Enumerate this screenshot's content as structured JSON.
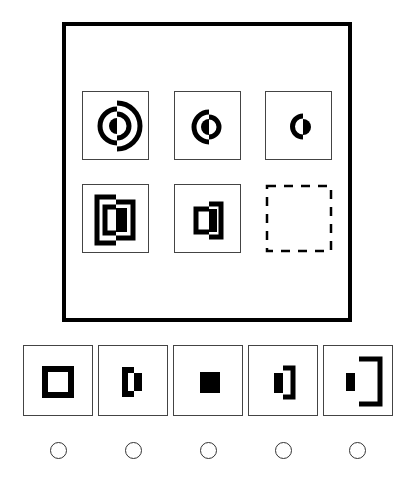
{
  "puzzle": {
    "type": "figure-matrix-reasoning",
    "rows": 2,
    "cols": 3,
    "cells": [
      {
        "row": 1,
        "col": 1,
        "figure": "three-ring split circle: left large ring + filled half-dot, right outer arc + middle arc"
      },
      {
        "row": 1,
        "col": 2,
        "figure": "two-ring split circle: left ring + filled half-dot, right middle arc"
      },
      {
        "row": 1,
        "col": 3,
        "figure": "one-ring split circle: left arc + filled right half-dot"
      },
      {
        "row": 2,
        "col": 1,
        "figure": "three nested split squares"
      },
      {
        "row": 2,
        "col": 2,
        "figure": "two nested split squares"
      },
      {
        "row": 2,
        "col": 3,
        "figure": "missing (dashed placeholder)"
      }
    ]
  },
  "options": [
    {
      "index": 1,
      "figure": "hollow square outline"
    },
    {
      "index": 2,
      "figure": "left bracket with filled right half-bar"
    },
    {
      "index": 3,
      "figure": "solid filled square"
    },
    {
      "index": 4,
      "figure": "filled left half-bar with right bracket"
    },
    {
      "index": 5,
      "figure": "small filled bar with large right bracket"
    }
  ],
  "radios": [
    "option-1",
    "option-2",
    "option-3",
    "option-4",
    "option-5"
  ],
  "colors": {
    "ink": "#000000",
    "border": "#444444",
    "background": "#ffffff"
  }
}
